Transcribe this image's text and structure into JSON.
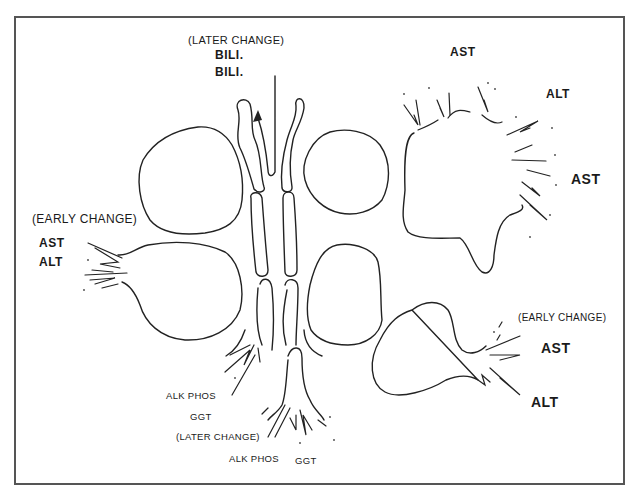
{
  "diagram": {
    "type": "schematic illustration of hepatocytes and bile canaliculi with enzyme leakage",
    "stroke_color": "#222222",
    "frame_color": "#555555",
    "labels": {
      "top_bile": {
        "note": "(LATER CHANGE)",
        "line1": "BILI.",
        "line2": "BILI."
      },
      "left_hepatocyte": {
        "note": "(EARLY CHANGE)",
        "line1": "AST",
        "line2": "ALT"
      },
      "upper_right_hepatocyte": {
        "line1": "AST",
        "line2": "ALT",
        "line3": "AST"
      },
      "lower_right_hepatocyte": {
        "note": "(EARLY CHANGE)",
        "line1": "AST",
        "line2": "ALT"
      },
      "bottom_duct": {
        "left_line1": "ALK PHOS",
        "left_line2": "GGT",
        "note": "(LATER CHANGE)",
        "bottom_left": "ALK PHOS",
        "bottom_right": "GGT"
      }
    }
  }
}
